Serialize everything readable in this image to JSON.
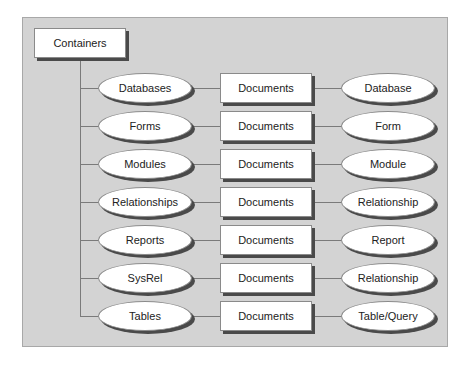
{
  "root": {
    "label": "Containers"
  },
  "rows": [
    {
      "container": "Databases",
      "collection": "Documents",
      "object": "Database"
    },
    {
      "container": "Forms",
      "collection": "Documents",
      "object": "Form"
    },
    {
      "container": "Modules",
      "collection": "Documents",
      "object": "Module"
    },
    {
      "container": "Relationships",
      "collection": "Documents",
      "object": "Relationship"
    },
    {
      "container": "Reports",
      "collection": "Documents",
      "object": "Report"
    },
    {
      "container": "SysRel",
      "collection": "Documents",
      "object": "Relationship"
    },
    {
      "container": "Tables",
      "collection": "Documents",
      "object": "Table/Query"
    }
  ],
  "colors": {
    "background": "#d3d3d3",
    "node_fill": "#ffffff",
    "shadow": "#4a4a4a",
    "line": "#7a7a7a"
  }
}
